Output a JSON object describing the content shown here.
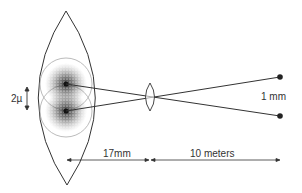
{
  "diagram": {
    "labels": {
      "retina_separation": "2µ",
      "object_separation": "1 mm",
      "eye_distance": "17mm",
      "object_distance": "10 meters"
    },
    "colors": {
      "stroke": "#333333",
      "stipple": "#555555",
      "circle": "#aaaaaa",
      "dot": "#222222"
    }
  }
}
